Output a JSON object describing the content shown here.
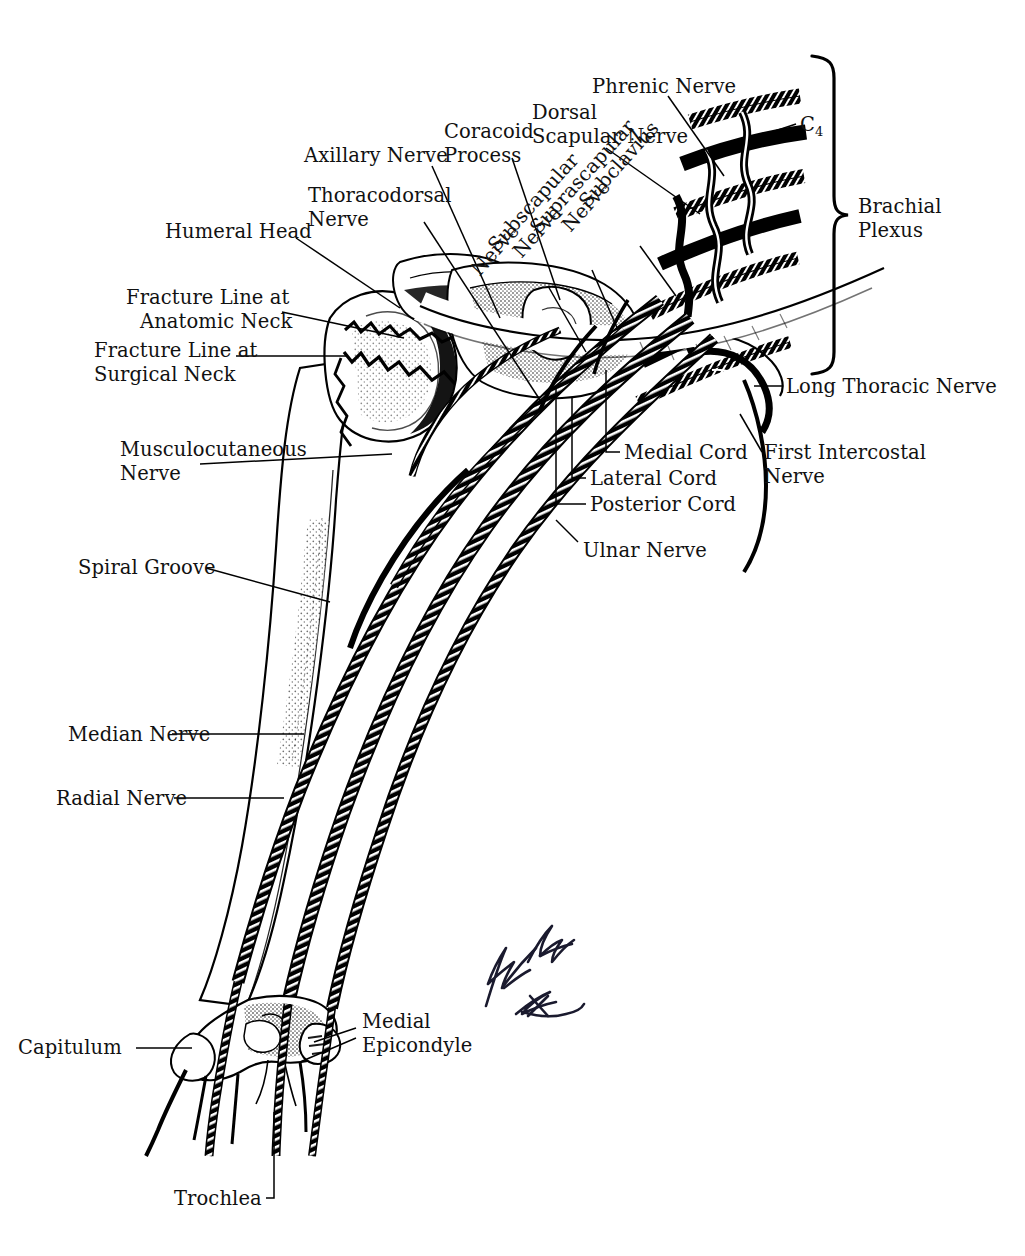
{
  "figure": {
    "type": "anatomical-illustration",
    "background_color": "#ffffff",
    "ink_color": "#000000",
    "artist_signature": "R. G. Bishop"
  },
  "bracket": {
    "label_line1": "Brachial",
    "label_line2": "Plexus"
  },
  "labels": {
    "phrenic_nerve": "Phrenic Nerve",
    "dorsal_line1": "Dorsal",
    "dorsal_line2": "Scapular Nerve",
    "coracoid_line1": "Coracoid",
    "coracoid_line2": "Process",
    "axillary_nerve": "Axillary Nerve",
    "thoracodorsal_line1": "Thoracodorsal",
    "thoracodorsal_line2": "Nerve",
    "humeral_head": "Humeral Head",
    "fracture_anatomic_line1": "Fracture Line at",
    "fracture_anatomic_line2": "Anatomic Neck",
    "fracture_surgical_line1": "Fracture Line at",
    "fracture_surgical_line2": "Surgical Neck",
    "musculocutaneous_line1": "Musculocutaneous",
    "musculocutaneous_line2": "Nerve",
    "spiral_groove": "Spiral Groove",
    "median_nerve": "Median Nerve",
    "radial_nerve": "Radial Nerve",
    "capitulum": "Capitulum",
    "medial_epicondyle_line1": "Medial",
    "medial_epicondyle_line2": "Epicondyle",
    "trochlea": "Trochlea",
    "ulnar_nerve": "Ulnar Nerve",
    "medial_cord": "Medial Cord",
    "lateral_cord": "Lateral Cord",
    "posterior_cord": "Posterior Cord",
    "long_thoracic_nerve": "Long Thoracic Nerve",
    "first_intercostal_line1": "First Intercostal",
    "first_intercostal_line2": "Nerve",
    "cervical_root": "C",
    "cervical_root_sub": "4"
  },
  "rotated_labels": {
    "subclavius_line1": "Subclavius",
    "subclavius_line2": "Nerve",
    "suprascapular_line1": "Suprascapular",
    "suprascapular_line2": "Nerve",
    "subscapular_line1": "Subscapular",
    "subscapular_line2": "Nerve"
  }
}
